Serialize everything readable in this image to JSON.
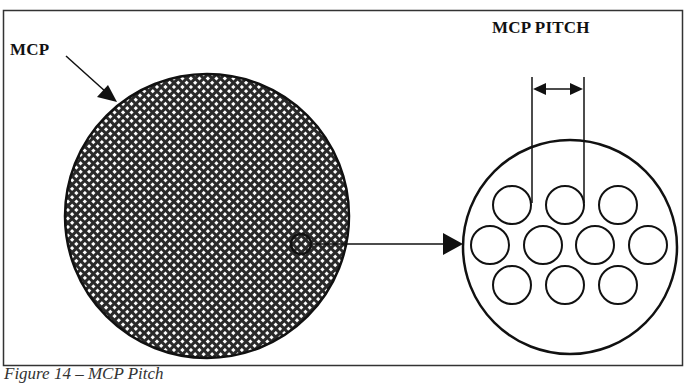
{
  "figure": {
    "labels": {
      "mcp": "MCP",
      "mcp_pitch": "MCP PITCH"
    },
    "caption": "Figure 14 – MCP Pitch",
    "colors": {
      "stroke": "#111111",
      "background": "#ffffff",
      "hatch": "#222222"
    },
    "elements": {
      "large_disk": {
        "cx": 207,
        "cy": 216,
        "r": 142,
        "fill": "crosshatch"
      },
      "sample_spot": {
        "cx": 301,
        "cy": 244,
        "r": 10
      },
      "magnified_view": {
        "cx": 570,
        "cy": 247,
        "r": 107
      },
      "pores": {
        "rows": [
          {
            "cy": 205,
            "cx": [
              512,
              565,
              618
            ]
          },
          {
            "cy": 245,
            "cx": [
              490,
              543,
              595,
              648
            ]
          },
          {
            "cy": 285,
            "cx": [
              512,
              565,
              618
            ]
          }
        ],
        "r": 19
      },
      "pitch_dimension": {
        "x1": 532,
        "x2": 584,
        "y": 89
      }
    }
  }
}
